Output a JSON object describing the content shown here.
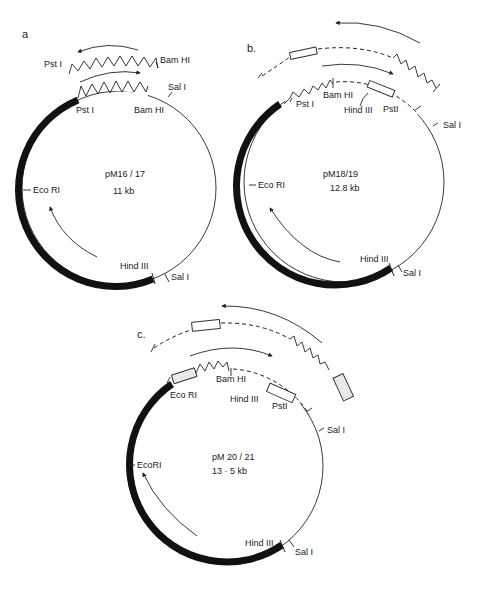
{
  "figure": {
    "panels": [
      {
        "id": "a",
        "panel_label": "a",
        "plasmid_name": "pM16 / 17",
        "size": "11 kb",
        "sites": {
          "pst_top": "Pst I",
          "bam_top": "Bam HI",
          "pst": "Pst I",
          "bam": "Bam HI",
          "sal_top": "Sal I",
          "eco": "Eco RI",
          "hind": "Hind III",
          "sal_bottom": "Sal I"
        }
      },
      {
        "id": "b",
        "panel_label": "b.",
        "plasmid_name": "pM18/19",
        "size": "12.8 kb",
        "sites": {
          "bam": "Bam HI",
          "pst_left": "Pst I",
          "hind_top": "Hind III",
          "pst_right": "PstI",
          "sal_top": "Sal I",
          "eco": "Eco RI",
          "hind": "Hind III",
          "sal_bottom": "Sal I"
        }
      },
      {
        "id": "c",
        "panel_label": "c.",
        "plasmid_name": "pM 20 / 21",
        "size": "13 · 5 kb",
        "sites": {
          "eco_top": "Eco RI",
          "bam": "Bam HI",
          "hind_top": "Hind III",
          "pst": "PstI",
          "sal_top": "Sal I",
          "eco": "EcoRI",
          "hind": "Hind III",
          "sal_bottom": "Sal I"
        }
      }
    ],
    "legend_colors": {
      "vector_backbone": "#111111",
      "insert_line": "#222222",
      "background": "#ffffff"
    }
  }
}
